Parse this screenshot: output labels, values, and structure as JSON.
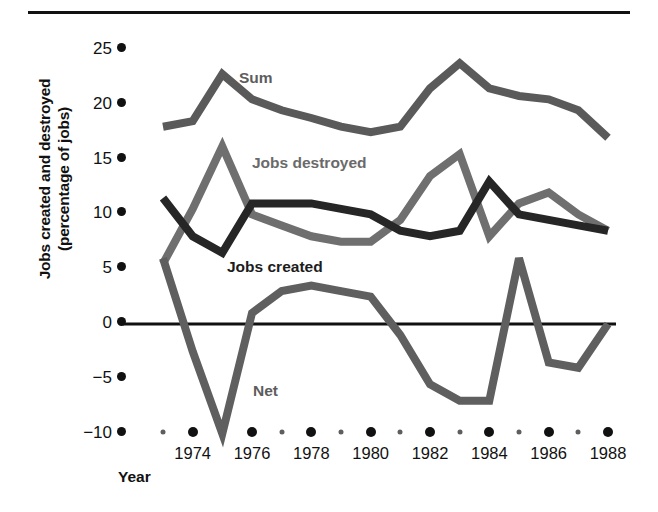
{
  "figure": {
    "has_top_rule": true,
    "background": "#ffffff"
  },
  "axis": {
    "ylabel_line1": "Jobs created and destroyed",
    "ylabel_line2": "(percentage of jobs)",
    "xlabel": "Year"
  },
  "labels": {
    "sum": "Sum",
    "jobs_destroyed": "Jobs destroyed",
    "jobs_created": "Jobs created",
    "net": "Net"
  },
  "colors": {
    "jobs_created": "#262626",
    "jobs_destroyed": "#6f6f6f",
    "sum": "#5a5a5a",
    "net": "#5f5f5f",
    "axis": "#111111"
  },
  "chart_data": {
    "type": "line",
    "title": "",
    "xlabel": "Year",
    "ylabel": "Jobs created and destroyed (percentage of jobs)",
    "x": [
      1973,
      1974,
      1975,
      1976,
      1977,
      1978,
      1979,
      1980,
      1981,
      1982,
      1983,
      1984,
      1985,
      1986,
      1987,
      1988
    ],
    "xlim": [
      1973,
      1988
    ],
    "ylim": [
      -10,
      25
    ],
    "ytick_labels": [
      "25",
      "20",
      "15",
      "10",
      "5",
      "0",
      "−5",
      "−10"
    ],
    "ytick_values": [
      25,
      20,
      15,
      10,
      5,
      0,
      -5,
      -10
    ],
    "xtick_major_labels": [
      "1974",
      "1976",
      "1978",
      "1980",
      "1982",
      "1984",
      "1986",
      "1988"
    ],
    "xtick_major_values": [
      1974,
      1976,
      1978,
      1980,
      1982,
      1984,
      1986,
      1988
    ],
    "xtick_minor_values": [
      1973,
      1975,
      1977,
      1979,
      1981,
      1983,
      1985,
      1987
    ],
    "grid": false,
    "legend_position": "inline-annotations",
    "zero_line": 0,
    "series": [
      {
        "name": "Sum",
        "color": "#5a5a5a",
        "values": [
          18.0,
          18.5,
          22.8,
          20.5,
          19.5,
          18.8,
          18.0,
          17.5,
          18.0,
          21.5,
          23.8,
          21.5,
          20.8,
          20.5,
          19.5,
          17.0
        ]
      },
      {
        "name": "Jobs destroyed",
        "color": "#6f6f6f",
        "values": [
          5.5,
          10.5,
          16.2,
          10.0,
          9.0,
          8.0,
          7.5,
          7.5,
          9.5,
          13.5,
          15.5,
          8.0,
          11.0,
          12.0,
          10.0,
          8.5
        ]
      },
      {
        "name": "Jobs created",
        "color": "#262626",
        "values": [
          11.5,
          8.0,
          6.5,
          11.0,
          11.0,
          11.0,
          10.5,
          10.0,
          8.5,
          8.0,
          8.5,
          13.0,
          10.0,
          9.5,
          9.0,
          8.5
        ]
      },
      {
        "name": "Net",
        "color": "#5f5f5f",
        "values": [
          6.0,
          -2.5,
          -10.0,
          1.0,
          3.0,
          3.5,
          3.0,
          2.5,
          -1.0,
          -5.5,
          -7.0,
          -7.0,
          6.0,
          -3.5,
          -4.0,
          0.0
        ]
      }
    ]
  }
}
